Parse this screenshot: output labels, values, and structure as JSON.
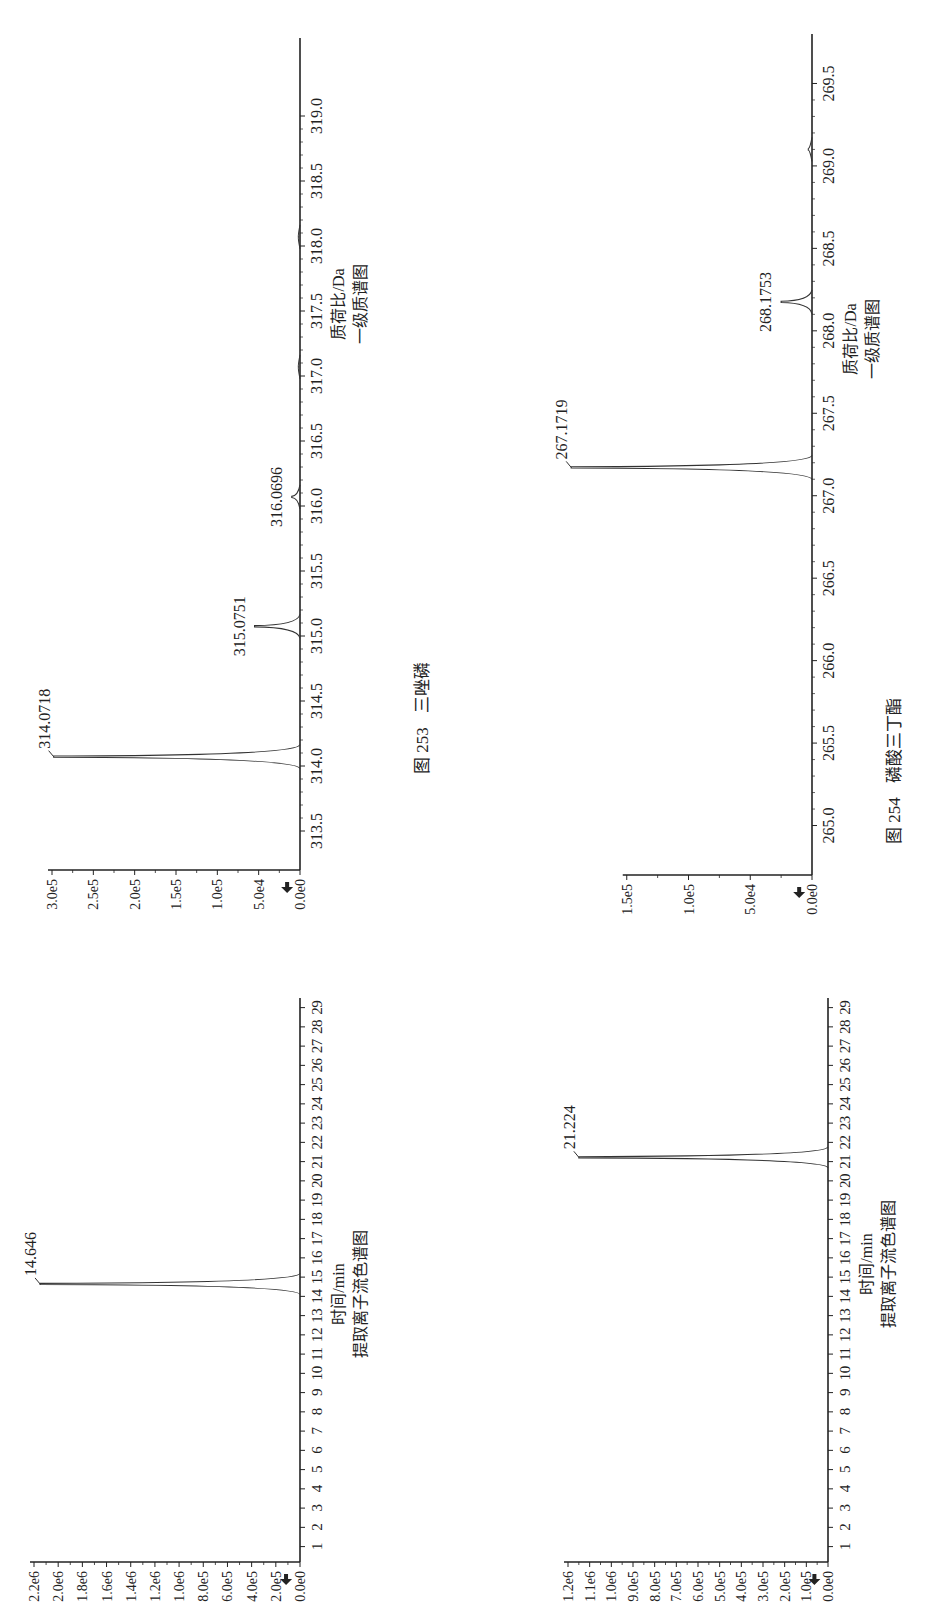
{
  "figures": [
    {
      "id": "253",
      "caption_prefix": "图 253",
      "caption_name": "三唑磷",
      "xic": {
        "xlabel": "时间/min",
        "subtitle": "提取离子流色谱图",
        "peak_label": "14.646"
      },
      "ms": {
        "xlabel": "质荷比/Da",
        "subtitle": "一级质谱图",
        "peak_labels": [
          "314.0718",
          "315.0751",
          "316.0696"
        ]
      }
    },
    {
      "id": "254",
      "caption_prefix": "图 254",
      "caption_name": "磷酸三丁酯",
      "xic": {
        "xlabel": "时间/min",
        "subtitle": "提取离子流色谱图",
        "peak_label": "21.224"
      },
      "ms": {
        "xlabel": "质荷比/Da",
        "subtitle": "一级质谱图",
        "peak_labels": [
          "267.1719",
          "268.1753"
        ]
      }
    }
  ],
  "chart_data": [
    {
      "type": "line",
      "title": "图 253 三唑磷 — 提取离子流色谱图",
      "xlabel": "时间/min",
      "ylabel": "",
      "x_ticks": [
        1,
        2,
        3,
        4,
        5,
        6,
        7,
        8,
        9,
        10,
        11,
        12,
        13,
        14,
        15,
        16,
        17,
        18,
        19,
        20,
        21,
        22,
        23,
        24,
        25,
        26,
        27,
        28,
        29
      ],
      "y_ticks": [
        "0.0e0",
        "2.0e5",
        "4.0e5",
        "6.0e5",
        "8.0e5",
        "1.0e6",
        "1.2e6",
        "1.4e6",
        "1.6e6",
        "1.8e6",
        "2.0e6",
        "2.2e6"
      ],
      "xlim": [
        0.2,
        29.5
      ],
      "ylim": [
        0,
        2200000
      ],
      "peaks": [
        {
          "x": 14.646,
          "y": 2150000,
          "label": "14.646"
        }
      ],
      "grid": false
    },
    {
      "type": "bar",
      "title": "图 253 三唑磷 — 一级质谱图",
      "xlabel": "质荷比/Da",
      "ylabel": "",
      "x_ticks": [
        313.5,
        314.0,
        314.5,
        315.0,
        315.5,
        316.0,
        316.5,
        317.0,
        317.5,
        318.0,
        318.5,
        319.0
      ],
      "y_ticks": [
        "0.0e0",
        "5.0e4",
        "1.0e5",
        "1.5e5",
        "2.0e5",
        "2.5e5",
        "3.0e5"
      ],
      "xlim": [
        313.2,
        319.6
      ],
      "ylim": [
        0,
        300000
      ],
      "peaks": [
        {
          "x": 314.0718,
          "y": 298000,
          "label": "314.0718"
        },
        {
          "x": 315.0751,
          "y": 55000,
          "label": "315.0751"
        },
        {
          "x": 316.0696,
          "y": 10000,
          "label": "316.0696"
        },
        {
          "x": 317.07,
          "y": 2000,
          "label": ""
        },
        {
          "x": 318.07,
          "y": 2000,
          "label": ""
        }
      ],
      "grid": false
    },
    {
      "type": "line",
      "title": "图 254 磷酸三丁酯 — 提取离子流色谱图",
      "xlabel": "时间/min",
      "ylabel": "",
      "x_ticks": [
        1,
        2,
        3,
        4,
        5,
        6,
        7,
        8,
        9,
        10,
        11,
        12,
        13,
        14,
        15,
        16,
        17,
        18,
        19,
        20,
        21,
        22,
        23,
        24,
        25,
        26,
        27,
        28,
        29
      ],
      "y_ticks": [
        "0.0e0",
        "1.0e5",
        "2.0e5",
        "3.0e5",
        "4.0e5",
        "5.0e5",
        "6.0e5",
        "7.0e5",
        "8.0e5",
        "9.0e5",
        "1.0e6",
        "1.1e6",
        "1.2e6"
      ],
      "xlim": [
        0.2,
        29.5
      ],
      "ylim": [
        0,
        1200000
      ],
      "peaks": [
        {
          "x": 21.224,
          "y": 1150000,
          "label": "21.224"
        }
      ],
      "grid": false
    },
    {
      "type": "bar",
      "title": "图 254 磷酸三丁酯 — 一级质谱图",
      "xlabel": "质荷比/Da",
      "ylabel": "",
      "x_ticks": [
        265.0,
        265.5,
        266.0,
        266.5,
        267.0,
        267.5,
        268.0,
        268.5,
        269.0,
        269.5
      ],
      "y_ticks": [
        "0.0e0",
        "5.0e4",
        "1.0e5",
        "1.5e5"
      ],
      "xlim": [
        264.7,
        269.8
      ],
      "ylim": [
        0,
        200000
      ],
      "peaks": [
        {
          "x": 267.1719,
          "y": 195000,
          "label": "267.1719"
        },
        {
          "x": 268.1753,
          "y": 25000,
          "label": "268.1753"
        },
        {
          "x": 269.1,
          "y": 3000,
          "label": ""
        }
      ],
      "grid": false
    }
  ]
}
